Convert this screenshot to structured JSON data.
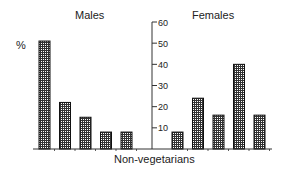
{
  "chart_data": {
    "type": "bar",
    "title": "",
    "xlabel": "Non-vegetarians",
    "ylabel": "%",
    "ylim": [
      0,
      60
    ],
    "yticks": [
      10,
      20,
      30,
      40,
      50,
      60
    ],
    "grid": false,
    "panels": [
      {
        "name": "Males",
        "values": [
          51,
          22,
          15,
          8,
          8
        ]
      },
      {
        "name": "Females",
        "values": [
          8,
          24,
          16,
          40,
          16
        ]
      }
    ],
    "bar_pattern": "crosshatch",
    "colors": {
      "bar_fill": "#555555",
      "bar_edge": "#111111",
      "axis": "#333333"
    }
  },
  "labels": {
    "males": "Males",
    "females": "Females",
    "percent": "%",
    "xlabel": "Non-vegetarians"
  }
}
